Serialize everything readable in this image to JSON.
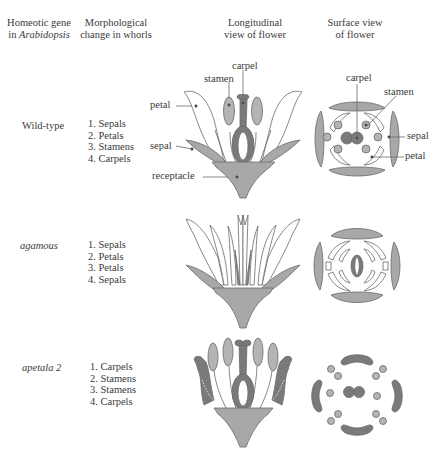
{
  "headers": {
    "gene": [
      "Homeotic gene",
      "in ",
      "Arabidopsis"
    ],
    "morph": [
      "Morphological",
      "change in whorls"
    ],
    "long": [
      "Longitudinal",
      "view of flower"
    ],
    "surface": [
      "Surface view",
      "of flower"
    ]
  },
  "rows": [
    {
      "gene": "Wild-type",
      "italic": false,
      "whorls": [
        "1. Sepals",
        "2. Petals",
        "3. Stamens",
        "4. Carpels"
      ]
    },
    {
      "gene": "agamous",
      "italic": true,
      "whorls": [
        "1. Sepals",
        "2. Petals",
        "3. Petals",
        "4. Sepals"
      ]
    },
    {
      "gene": "apetala 2",
      "italic": true,
      "whorls": [
        "1. Carpels",
        "2. Stamens",
        "3. Stamens",
        "4. Carpels"
      ]
    }
  ],
  "labels": {
    "longitudinal": {
      "carpel": "carpel",
      "stamen": "stamen",
      "petal": "petal",
      "sepal": "sepal",
      "receptacle": "receptacle"
    },
    "surface": {
      "carpel": "carpel",
      "stamen": "stamen",
      "sepal": "sepal",
      "petal": "petal"
    }
  },
  "colors": {
    "sepal": "#a8a8a8",
    "carpel_dark": "#7a7a7a",
    "stamen": "#b4b4b4",
    "outline": "#6a6a6a",
    "background": "#ffffff"
  }
}
